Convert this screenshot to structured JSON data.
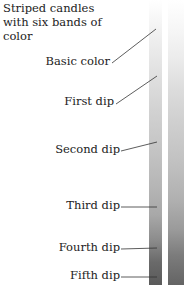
{
  "title": "Striped candles with six bands of color",
  "labels": [
    {
      "text": "Basic color"
    },
    {
      "text": "First dip"
    },
    {
      "text": "Second dip"
    },
    {
      "text": "Third dip"
    },
    {
      "text": "Fourth dip"
    },
    {
      "text": "Fifth dip"
    }
  ],
  "colors": {
    "text": "#222222",
    "leader_line": "#333333",
    "candle_top": "#ffffff",
    "candle_bottom": "#5a5a5a"
  }
}
